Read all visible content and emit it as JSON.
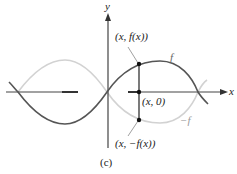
{
  "figure": {
    "caption": "(c)",
    "axes": {
      "x_label": "x",
      "y_label": "y"
    },
    "curves": [
      {
        "name": "f",
        "label": "f",
        "color": "#555555",
        "description": "sine-like curve through origin"
      },
      {
        "name": "neg-f",
        "label": "−f",
        "color": "#cfcfcf",
        "description": "reflection of f across the x-axis"
      }
    ],
    "points": [
      {
        "name": "point-f",
        "label": "(x, f(x))"
      },
      {
        "name": "point-zero",
        "label": "(x, 0)"
      },
      {
        "name": "point-neg-f",
        "label": "(x, −f(x))"
      }
    ],
    "colors": {
      "axis": "#444444",
      "f_curve": "#555555",
      "neg_f_curve": "#cfcfcf",
      "points": "#111111"
    }
  }
}
